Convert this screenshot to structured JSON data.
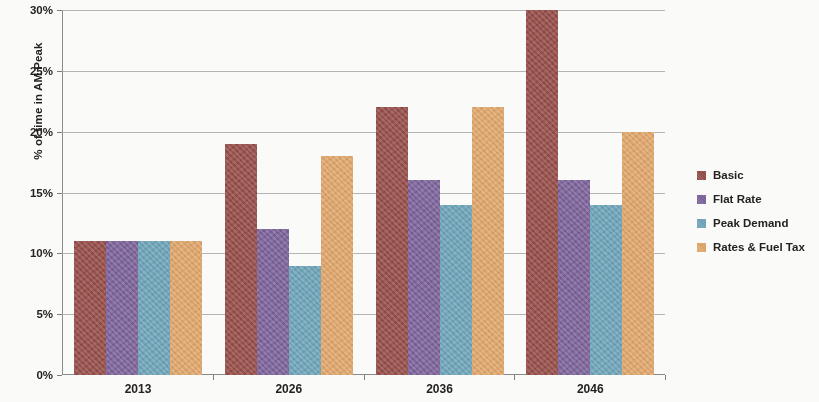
{
  "chart_data": {
    "type": "bar",
    "title": "",
    "subtitle": "",
    "xlabel": "",
    "ylabel": "% of time in AM Peak",
    "categories": [
      "2013",
      "2026",
      "2036",
      "2046"
    ],
    "series": [
      {
        "name": "Basic",
        "color": "#9C4B46",
        "values": [
          11,
          19,
          22,
          30
        ]
      },
      {
        "name": "Flat Rate",
        "color": "#7E62A0",
        "values": [
          11,
          12,
          16,
          16
        ]
      },
      {
        "name": "Peak Demand",
        "color": "#6BA7BE",
        "values": [
          11,
          9,
          14,
          14
        ]
      },
      {
        "name": "Rates & Fuel Tax",
        "color": "#E8A866",
        "values": [
          11,
          18,
          22,
          20
        ]
      }
    ],
    "ylim": [
      0,
      30
    ],
    "y_tick_values": [
      0,
      5,
      10,
      15,
      20,
      25,
      30
    ],
    "y_tick_labels": [
      "0%",
      "5%",
      "10%",
      "15%",
      "20%",
      "25%",
      "30%"
    ],
    "y_unit": "%",
    "grid": "horizontal",
    "legend_position": "right"
  }
}
